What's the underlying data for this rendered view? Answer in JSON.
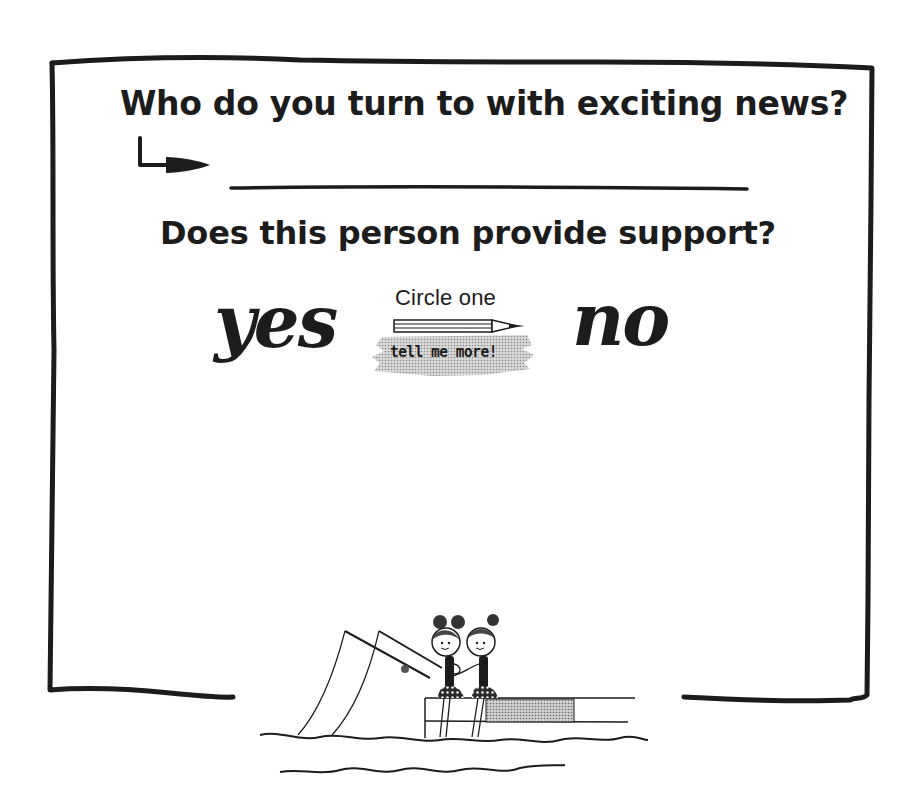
{
  "card": {
    "question_1": "Who do you turn to with exciting news?",
    "answer_1_value": "",
    "question_2": "Does this person provide support?",
    "option_yes": "yes",
    "option_no": "no",
    "instruction": "Circle one",
    "more_link": "tell me more!"
  },
  "icons": {
    "arrow": "bent-arrow-right-icon",
    "pencil": "pencil-icon",
    "illustration": "two-girls-fishing-on-dock"
  },
  "colors": {
    "ink": "#1c1c1c",
    "background": "#ffffff",
    "highlight": "#bdbdbd"
  }
}
